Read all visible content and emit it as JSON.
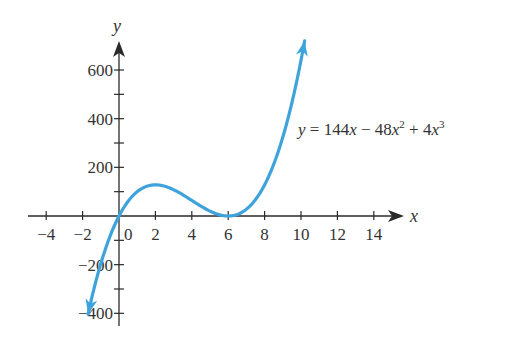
{
  "chart_data": {
    "type": "line",
    "title": "",
    "xlabel": "x",
    "ylabel": "y",
    "xlim": [
      -4.5,
      15.5
    ],
    "ylim": [
      -430,
      720
    ],
    "x_ticks": [
      -4,
      -2,
      2,
      4,
      6,
      8,
      10,
      12,
      14
    ],
    "x_tick_labels": [
      "−4",
      "−2",
      "2",
      "4",
      "6",
      "8",
      "10",
      "12",
      "14"
    ],
    "y_major_ticks": [
      600,
      400,
      200,
      -200,
      -400
    ],
    "y_tick_labels": [
      "600",
      "400",
      "200",
      "−200",
      "−400"
    ],
    "y_minor_ticks": [
      500,
      300,
      100,
      -100,
      -300
    ],
    "origin_label": "0",
    "grid": false,
    "legend": null,
    "annotation": {
      "text_parts": [
        "y",
        " = 144",
        "x",
        " − 48",
        "x",
        "2",
        " + 4",
        "x",
        "3"
      ],
      "position": "right of rising branch, near y≈400"
    },
    "series": [
      {
        "name": "y = 144x − 48x² + 4x³",
        "formula": "144x - 48x^2 + 4x^3",
        "color": "#3ea3dc",
        "x_range": [
          -1.7,
          10.2
        ],
        "arrows": "both ends",
        "x": [
          -1.7,
          -1,
          0,
          1,
          2,
          3,
          4,
          5,
          6,
          7,
          8,
          9,
          10,
          10.2
        ],
        "y": [
          -403,
          -196,
          0,
          100,
          128,
          108,
          64,
          20,
          0,
          28,
          128,
          324,
          640,
          720
        ]
      }
    ],
    "key_points": [
      {
        "label": "origin",
        "x": 0,
        "y": 0
      },
      {
        "label": "local max",
        "x": 2,
        "y": 128
      },
      {
        "label": "local min (double root)",
        "x": 6,
        "y": 0
      }
    ]
  },
  "labels": {
    "x_axis": "x",
    "y_axis": "y",
    "origin": "0"
  },
  "colors": {
    "curve": "#3ea3dc",
    "axis": "#2a2a2a",
    "text": "#333333"
  }
}
